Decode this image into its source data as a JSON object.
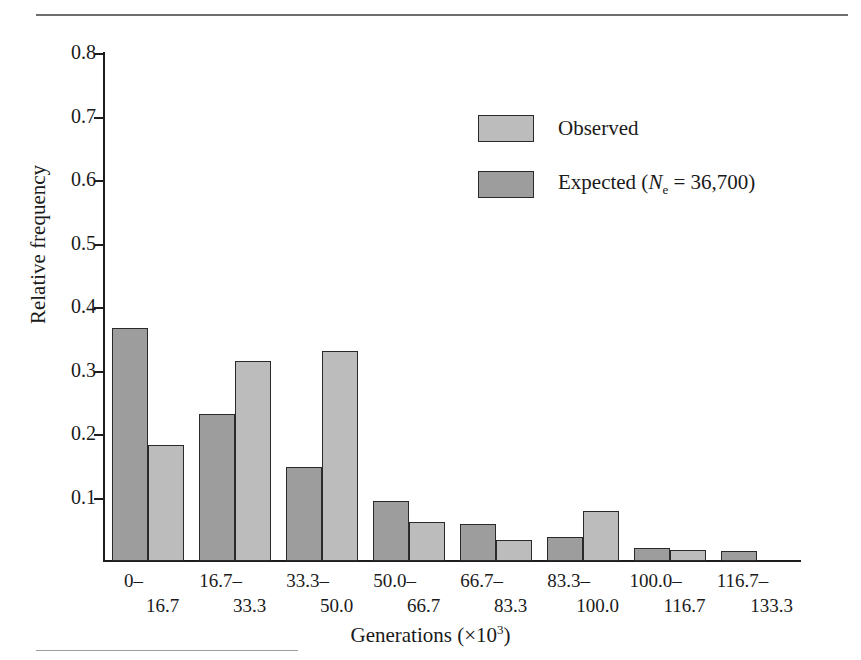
{
  "figure": {
    "top_rule": "horizontal-rule",
    "bottom_rule": "horizontal-rule"
  },
  "legend": {
    "position": "upper-center-right",
    "entries": [
      {
        "label": "Observed",
        "color": "#bcbcbc",
        "swatch": "observed-swatch"
      },
      {
        "label_prefix": "Expected (",
        "symbol": "N",
        "subscript": "e",
        "label_mid": " = 36,700)",
        "color": "#9d9d9d",
        "swatch": "expected-swatch"
      }
    ]
  },
  "axes": {
    "y_title": "Relative frequency",
    "x_title_text": "Generations (×10",
    "x_title_exp": "3",
    "x_title_close": ")",
    "y_ticks": [
      "0.1",
      "0.2",
      "0.3",
      "0.4",
      "0.5",
      "0.6",
      "0.7",
      "0.8"
    ],
    "y_tick_values": [
      0.1,
      0.2,
      0.3,
      0.4,
      0.5,
      0.6,
      0.7,
      0.8
    ]
  },
  "chart_data": {
    "type": "bar",
    "title": "",
    "xlabel": "Generations (×10^3)",
    "ylabel": "Relative frequency",
    "ylim": [
      0,
      0.8
    ],
    "grid": false,
    "legend_position": "upper right",
    "categories": [
      "0–16.7",
      "16.7–33.3",
      "33.3–50.0",
      "50.0–66.7",
      "66.7–83.3",
      "83.3–100.0",
      "100.0–116.7",
      "116.7–133.3"
    ],
    "category_lines": [
      {
        "line1": "0–",
        "line2": "16.7"
      },
      {
        "line1": "16.7–",
        "line2": "33.3"
      },
      {
        "line1": "33.3–",
        "line2": "50.0"
      },
      {
        "line1": "50.0–",
        "line2": "66.7"
      },
      {
        "line1": "66.7–",
        "line2": "83.3"
      },
      {
        "line1": "83.3–",
        "line2": "100.0"
      },
      {
        "line1": "100.0–",
        "line2": "116.7"
      },
      {
        "line1": "116.7–",
        "line2": "133.3"
      }
    ],
    "series": [
      {
        "name": "Expected (Ne = 36,700)",
        "color": "#9d9d9d",
        "values": [
          0.367,
          0.231,
          0.148,
          0.095,
          0.058,
          0.038,
          0.021,
          0.016
        ]
      },
      {
        "name": "Observed",
        "color": "#bcbcbc",
        "values": [
          0.182,
          0.315,
          0.33,
          0.061,
          0.033,
          0.078,
          0.017,
          0.0
        ]
      }
    ]
  }
}
